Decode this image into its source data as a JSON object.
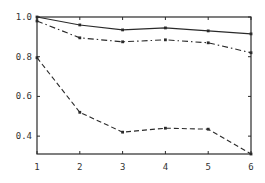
{
  "chart_data": {
    "type": "line",
    "title": "",
    "xlabel": "",
    "ylabel": "",
    "x": [
      1,
      2,
      3,
      4,
      5,
      6
    ],
    "xticks": [
      "1",
      "2",
      "3",
      "4",
      "5",
      "6"
    ],
    "yticks": [
      {
        "value": 1.0,
        "label": "1.0"
      },
      {
        "value": 0.8,
        "label": "0.8"
      },
      {
        "value": 0.6,
        "label": "0.6"
      },
      {
        "value": 0.4,
        "label": "0.4"
      }
    ],
    "xlim": [
      1,
      6
    ],
    "ylim": [
      0.31,
      1.0
    ],
    "grid": false,
    "legend": null,
    "series": [
      {
        "name": "solid",
        "style": "solid",
        "values": [
          1.0,
          0.96,
          0.935,
          0.945,
          0.93,
          0.915
        ]
      },
      {
        "name": "dash-dot",
        "style": "dashdot",
        "values": [
          0.98,
          0.895,
          0.875,
          0.885,
          0.87,
          0.82
        ]
      },
      {
        "name": "dashed",
        "style": "dashed",
        "values": [
          0.795,
          0.52,
          0.42,
          0.44,
          0.435,
          0.31
        ]
      }
    ]
  },
  "layout": {
    "plot_left": 37,
    "plot_right": 251,
    "plot_top": 17,
    "plot_bottom": 154,
    "line_color": "#2a2a2a",
    "background": "#ffffff"
  }
}
